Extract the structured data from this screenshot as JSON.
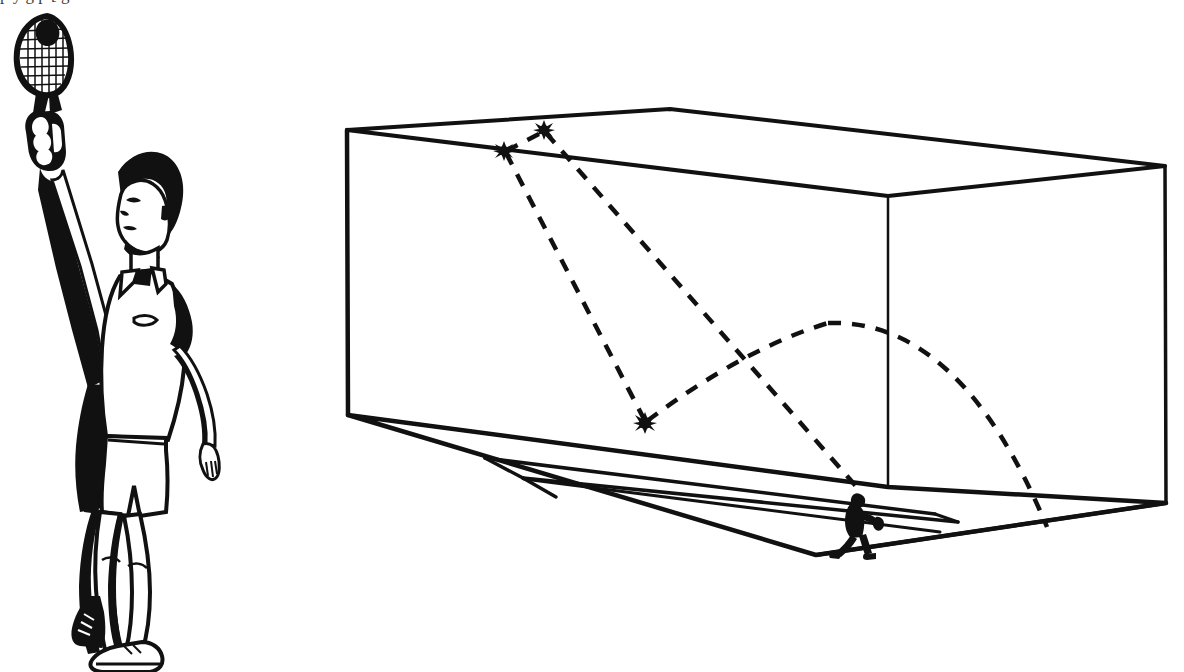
{
  "figure": {
    "caption_remnant": "p y g p [ g",
    "background_color": "#ffffff",
    "ink_color": "#1a1a1a"
  },
  "illustration": {
    "name": "player-serving-illustration",
    "description": "Line-art illustration of a racquetball player with arm raised holding a racquet overhead",
    "parts": [
      {
        "name": "racquet",
        "label": "Racquet"
      },
      {
        "name": "ball",
        "label": "Ball"
      },
      {
        "name": "hand-grip",
        "label": "Gripping hand"
      },
      {
        "name": "raised-arm",
        "label": "Raised arm"
      },
      {
        "name": "head",
        "label": "Head"
      },
      {
        "name": "shirt",
        "label": "Polo shirt"
      },
      {
        "name": "shorts",
        "label": "Shorts"
      },
      {
        "name": "legs",
        "label": "Legs"
      },
      {
        "name": "shoes",
        "label": "Shoes"
      }
    ]
  },
  "court_diagram": {
    "name": "court-perspective-diagram",
    "description": "Three-dimensional perspective wireframe of an enclosed racquetball court",
    "view": "isometric-perspective from outside the front-left corner",
    "walls": [
      {
        "name": "front-wall",
        "label": "Front wall"
      },
      {
        "name": "side-wall",
        "label": "Side wall"
      },
      {
        "name": "ceiling",
        "label": "Ceiling"
      },
      {
        "name": "floor",
        "label": "Floor"
      },
      {
        "name": "back-wall",
        "label": "Back wall"
      }
    ],
    "floor_markings": [
      {
        "name": "short-line",
        "label": "Short line"
      },
      {
        "name": "service-line",
        "label": "Service line"
      },
      {
        "name": "service-box",
        "label": "Service box"
      }
    ],
    "impact_points": [
      {
        "name": "impact-ceiling-front",
        "label": "Ceiling impact",
        "x": 504,
        "y": 151
      },
      {
        "name": "impact-ceiling-rear",
        "label": "Ceiling impact",
        "x": 544,
        "y": 130
      },
      {
        "name": "impact-floor",
        "label": "Floor bounce",
        "x": 645,
        "y": 423
      }
    ],
    "trajectories": [
      {
        "name": "ceiling-rebound-path",
        "style": "dashed",
        "label": "Ball path off ceiling"
      },
      {
        "name": "floor-bounce-path",
        "style": "dashed",
        "label": "Ball path after floor bounce"
      },
      {
        "name": "parabolic-arc-path",
        "style": "dashed",
        "label": "Arcing ball rebound"
      }
    ],
    "player_marker": {
      "name": "player-silhouette",
      "label": "Receiving player",
      "x": 855,
      "y": 515
    }
  }
}
